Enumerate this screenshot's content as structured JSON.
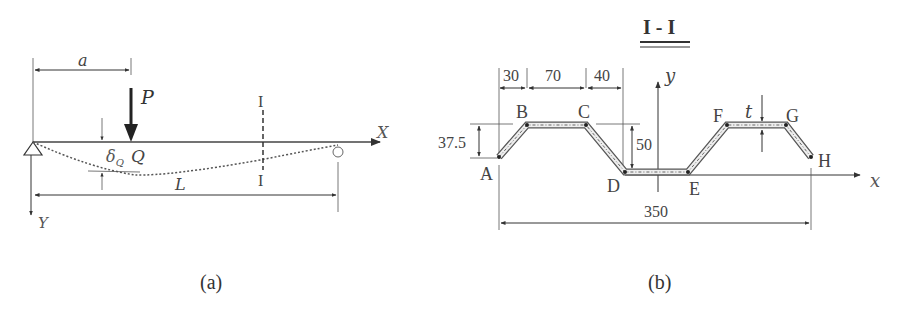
{
  "figure_a": {
    "caption": "(a)",
    "labels": {
      "a": "a",
      "P": "P",
      "X": "X",
      "Y": "Y",
      "Q": "Q",
      "delta": "δ",
      "delta_sub": "Q",
      "L": "L",
      "section_top": "I",
      "section_bottom": "I"
    }
  },
  "figure_b": {
    "caption": "(b)",
    "section_title": "I - I",
    "points": [
      "A",
      "B",
      "C",
      "D",
      "E",
      "F",
      "G",
      "H"
    ],
    "dimensions": {
      "d30": "30",
      "d70": "70",
      "d40": "40",
      "h37": "37.5",
      "h50": "50",
      "w350": "350",
      "t": "t"
    },
    "axes": {
      "x": "x",
      "y": "y"
    }
  }
}
